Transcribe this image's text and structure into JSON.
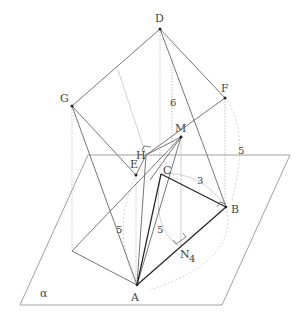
{
  "figure": {
    "type": "3d-geometry-diagram",
    "plane_label": "α",
    "points": {
      "A": {
        "label": "A",
        "x": 137,
        "y": 285,
        "lx": 131,
        "ly": 301
      },
      "B": {
        "label": "B",
        "x": 226,
        "y": 207,
        "lx": 231,
        "ly": 213
      },
      "C": {
        "label": "C",
        "x": 161,
        "y": 174,
        "lx": 163,
        "ly": 174
      },
      "D": {
        "label": "D",
        "x": 160,
        "y": 29,
        "lx": 155,
        "ly": 22
      },
      "E": {
        "label": "E",
        "x": 136,
        "y": 175,
        "lx": 130,
        "ly": 168
      },
      "F": {
        "label": "F",
        "x": 225,
        "y": 98,
        "lx": 221,
        "ly": 92
      },
      "G": {
        "label": "G",
        "x": 72,
        "y": 106,
        "lx": 60,
        "ly": 102
      },
      "H": {
        "label": "H",
        "x": 146,
        "y": 155,
        "lx": 136,
        "ly": 159
      },
      "M": {
        "label": "M",
        "x": 181,
        "y": 137,
        "lx": 175,
        "ly": 132
      },
      "N": {
        "label": "N",
        "x": 181,
        "y": 247,
        "lx": 180,
        "ly": 258
      }
    },
    "measurements": [
      {
        "text": "6",
        "x": 170,
        "y": 106
      },
      {
        "text": "5",
        "x": 238,
        "y": 154
      },
      {
        "text": "3",
        "x": 197,
        "y": 184
      },
      {
        "text": "5",
        "x": 116,
        "y": 233
      },
      {
        "text": "5",
        "x": 157,
        "y": 233
      },
      {
        "text": "4",
        "x": 189,
        "y": 262
      }
    ],
    "plane": {
      "points": "88,155 290,155 222,305 20,305",
      "label_x": 40,
      "label_y": 297
    }
  }
}
